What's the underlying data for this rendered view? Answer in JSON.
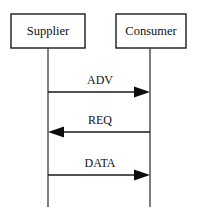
{
  "diagram": {
    "type": "uml-sequence-diagram",
    "canvas": {
      "width": 197,
      "height": 217,
      "background": "#ffffff"
    },
    "colors": {
      "stroke": "#1a1a1a",
      "lifeline": "#3a3a3a",
      "arrowhead": "#0d0d0d",
      "box_fill": "#ffffff",
      "text": "#111111"
    },
    "participants": [
      {
        "id": "supplier",
        "label": "Supplier",
        "box": {
          "x": 11,
          "y": 14,
          "width": 74,
          "height": 34
        },
        "label_x": 48,
        "label_y": 31,
        "lifeline_x": 48,
        "lifeline_y1": 48,
        "lifeline_y2": 207
      },
      {
        "id": "consumer",
        "label": "Consumer",
        "box": {
          "x": 116,
          "y": 14,
          "width": 70,
          "height": 34
        },
        "label_x": 151,
        "label_y": 31,
        "lifeline_x": 150,
        "lifeline_y1": 48,
        "lifeline_y2": 207
      }
    ],
    "messages": [
      {
        "id": "adv",
        "label": "ADV",
        "from": "supplier",
        "to": "consumer",
        "direction": "right",
        "y": 92,
        "x1": 48,
        "x2": 150,
        "label_x": 100,
        "label_y": 80,
        "arrow_style": "solid-filled"
      },
      {
        "id": "req",
        "label": "REQ",
        "from": "consumer",
        "to": "supplier",
        "direction": "left",
        "y": 132,
        "x1": 150,
        "x2": 48,
        "label_x": 100,
        "label_y": 120,
        "arrow_style": "solid-filled"
      },
      {
        "id": "data",
        "label": "DATA",
        "from": "supplier",
        "to": "consumer",
        "direction": "right",
        "y": 175,
        "x1": 48,
        "x2": 150,
        "label_x": 100,
        "label_y": 163,
        "arrow_style": "solid-filled"
      }
    ]
  }
}
